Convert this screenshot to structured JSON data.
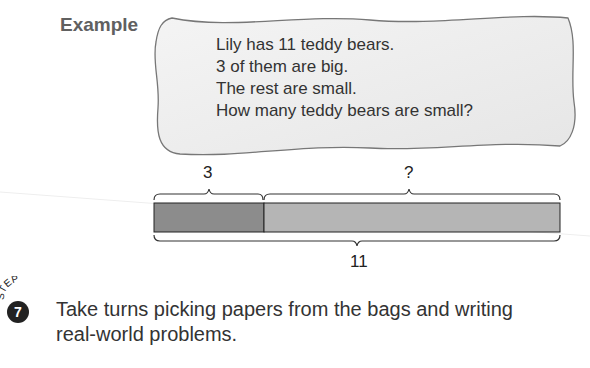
{
  "example_label": "Example",
  "problem": {
    "lines": [
      "Lily has 11 teddy bears.",
      "3 of them are big.",
      "The rest are small.",
      "How many teddy bears are small?"
    ]
  },
  "bar_model": {
    "part_known_label": "3",
    "part_unknown_label": "?",
    "whole_label": "11",
    "colors": {
      "known": "#8c8c8c",
      "unknown": "#b5b5b5",
      "border": "#222222"
    }
  },
  "step": {
    "badge_word": "STEP",
    "number": "7",
    "text_lines": [
      "Take turns picking papers from the bags and writing",
      "real-world problems."
    ]
  }
}
